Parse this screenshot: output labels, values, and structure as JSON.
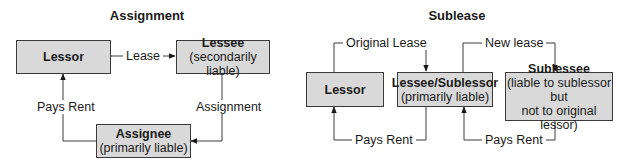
{
  "assignment": {
    "title": "Assignment",
    "nodes": {
      "lessor": {
        "name": "Lessor"
      },
      "lessee": {
        "name": "Lessee",
        "note": "(secondarily liable)"
      },
      "assignee": {
        "name": "Assignee",
        "note": "(primarily liable)"
      }
    },
    "edges": {
      "lease": "Lease",
      "assignment": "Assignment",
      "pays_rent": "Pays Rent"
    }
  },
  "sublease": {
    "title": "Sublease",
    "nodes": {
      "lessor": {
        "name": "Lessor"
      },
      "sublessor": {
        "name": "Lessee/Sublessor",
        "note": "(primarily liable)"
      },
      "sublessee": {
        "name": "Sublessee",
        "note_line1": "(liable to sublessor but",
        "note_line2": "not to original lessor)"
      }
    },
    "edges": {
      "original_lease": "Original Lease",
      "new_lease": "New lease",
      "pays_rent_1": "Pays Rent",
      "pays_rent_2": "Pays Rent"
    }
  },
  "colors": {
    "box_fill": "#d9d9d9",
    "line": "#3a3a3a"
  }
}
